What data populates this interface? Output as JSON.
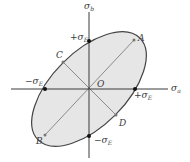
{
  "diagram": {
    "colors": {
      "axis": "#3a3a3a",
      "ellipse_stroke": "#444444",
      "ellipse_fill": "#e6e6e6",
      "diagonal": "#8a8a8a",
      "point": "#111111"
    },
    "axes": {
      "x_label": "σ",
      "x_sub": "a",
      "y_label": "σ",
      "y_sub": "b",
      "origin_label": "O"
    },
    "intercepts": {
      "pos_x": {
        "sign": "+σ",
        "sub": "E"
      },
      "neg_x": {
        "sign": "−σ",
        "sub": "E"
      },
      "pos_y": {
        "sign": "+σ",
        "sub": "E"
      },
      "neg_y": {
        "sign": "−σ",
        "sub": "E"
      }
    },
    "points": {
      "A": "A",
      "B": "B",
      "C": "C",
      "D": "D"
    }
  }
}
